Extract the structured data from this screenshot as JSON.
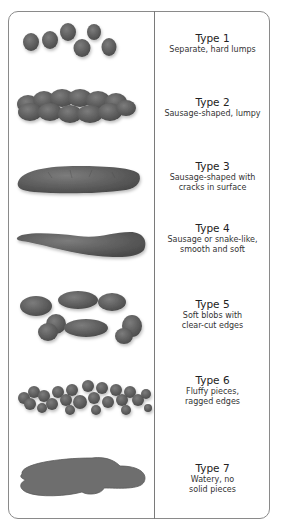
{
  "chart_title": "",
  "colors": {
    "stool": "#595959",
    "stool_light": "#7a7a7a",
    "border": "#8a8a8a"
  },
  "types": [
    {
      "title": "Type 1",
      "description_lines": [
        "Separate, hard lumps"
      ],
      "illustration": "separate-lumps-icon"
    },
    {
      "title": "Type 2",
      "description_lines": [
        "Sausage-shaped, lumpy"
      ],
      "illustration": "lumpy-sausage-icon"
    },
    {
      "title": "Type 3",
      "description_lines": [
        "Sausage-shaped with",
        "cracks in surface"
      ],
      "illustration": "cracked-sausage-icon"
    },
    {
      "title": "Type 4",
      "description_lines": [
        "Sausage or snake-like,",
        "smooth and soft"
      ],
      "illustration": "smooth-snake-icon"
    },
    {
      "title": "Type 5",
      "description_lines": [
        "Soft blobs with",
        "clear-cut edges"
      ],
      "illustration": "soft-blobs-icon"
    },
    {
      "title": "Type 6",
      "description_lines": [
        "Fluffy pieces,",
        "ragged edges"
      ],
      "illustration": "fluffy-pieces-icon"
    },
    {
      "title": "Type 7",
      "description_lines": [
        "Watery, no",
        "solid pieces"
      ],
      "illustration": "watery-puddle-icon"
    }
  ]
}
